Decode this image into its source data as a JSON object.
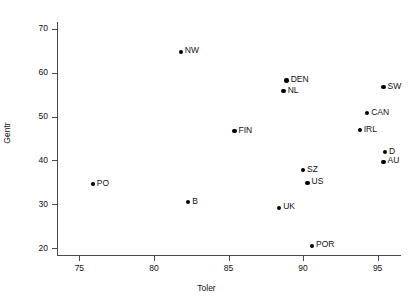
{
  "chart_data": {
    "type": "scatter",
    "title": "",
    "xlabel": "Toler",
    "ylabel": "Gentr",
    "xlim": [
      73.5,
      96.5
    ],
    "ylim": [
      18.5,
      71.5
    ],
    "xticks": [
      75,
      80,
      85,
      90,
      95
    ],
    "yticks": [
      20,
      30,
      40,
      50,
      60,
      70
    ],
    "grid": false,
    "legend": "none",
    "marker_color": "#000000",
    "axis_color": "#4a4a4a",
    "points": [
      {
        "label": "NW",
        "x": 81.8,
        "y": 64.7,
        "label_pos": "right"
      },
      {
        "label": "DEN",
        "x": 88.9,
        "y": 58.2,
        "label_pos": "right"
      },
      {
        "label": "NL",
        "x": 88.7,
        "y": 55.8,
        "label_pos": "right"
      },
      {
        "label": "SW",
        "x": 95.4,
        "y": 56.7,
        "label_pos": "right"
      },
      {
        "label": "CAN",
        "x": 94.3,
        "y": 50.8,
        "label_pos": "right"
      },
      {
        "label": "IRL",
        "x": 93.8,
        "y": 46.9,
        "label_pos": "right"
      },
      {
        "label": "FIN",
        "x": 85.4,
        "y": 46.7,
        "label_pos": "right"
      },
      {
        "label": "D",
        "x": 95.5,
        "y": 41.9,
        "label_pos": "right"
      },
      {
        "label": "AU",
        "x": 95.4,
        "y": 39.7,
        "label_pos": "right"
      },
      {
        "label": "SZ",
        "x": 90.0,
        "y": 37.8,
        "label_pos": "right"
      },
      {
        "label": "US",
        "x": 90.3,
        "y": 34.9,
        "label_pos": "right"
      },
      {
        "label": "PO",
        "x": 75.9,
        "y": 34.6,
        "label_pos": "right"
      },
      {
        "label": "B",
        "x": 82.3,
        "y": 30.5,
        "label_pos": "right"
      },
      {
        "label": "UK",
        "x": 88.4,
        "y": 29.2,
        "label_pos": "right"
      },
      {
        "label": "POR",
        "x": 90.6,
        "y": 20.6,
        "label_pos": "right"
      }
    ]
  }
}
